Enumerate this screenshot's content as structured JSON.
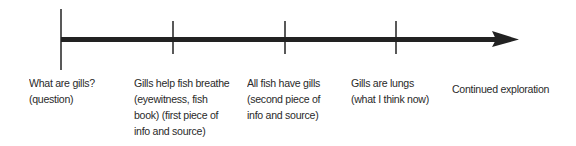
{
  "timeline": {
    "line_color": "#222222",
    "text_color": "#2a2a2a",
    "events": [
      {
        "label": "What are gills?",
        "detail": "(question)",
        "lines": [
          "What are gills?",
          "(question)"
        ]
      },
      {
        "label": "Gills help fish breathe",
        "lines": [
          "Gills help fish breathe",
          "(eyewitness, fish",
          "book) (first piece of",
          "info and source)"
        ]
      },
      {
        "label": "All fish have gills",
        "lines": [
          "All fish have gills",
          "(second piece of",
          "info and source)"
        ]
      },
      {
        "label": "Gills are lungs",
        "lines": [
          "Gills are lungs",
          "(what I think now)"
        ]
      },
      {
        "label": "Continued exploration",
        "lines": [
          "Continued exploration"
        ]
      }
    ]
  }
}
